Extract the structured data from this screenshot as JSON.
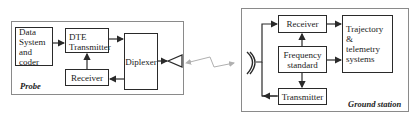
{
  "probe": {
    "label": "Probe",
    "blocks": {
      "data_system": "Data\nSystem\nand coder",
      "dte_transmitter": "DTE\nTransmitter",
      "receiver": "Receiver",
      "diplexer": "Diplexer"
    },
    "antenna": "horn-antenna"
  },
  "link": {
    "type": "zigzag-radio-link",
    "direction": "bidirectional"
  },
  "ground_station": {
    "label": "Ground station",
    "blocks": {
      "receiver": "Receiver",
      "frequency_standard": "Frequency\nstandard",
      "transmitter": "Transmitter",
      "trajectory": "Trajectory &\ntelemetry\nsystems"
    },
    "antenna": "dish-antenna"
  },
  "colors": {
    "line": "#2a2a2a",
    "frame": "#8a8a8a",
    "link": "#b0b0b0"
  }
}
